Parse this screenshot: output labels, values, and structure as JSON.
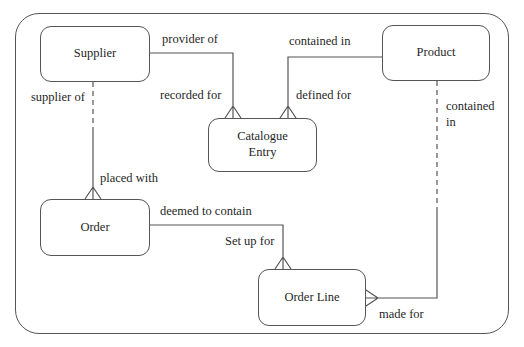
{
  "diagram": {
    "type": "entity-relationship",
    "notation": "crow-foot",
    "entities": [
      {
        "id": "supplier",
        "label": "Supplier"
      },
      {
        "id": "product",
        "label": "Product"
      },
      {
        "id": "catalogue_entry",
        "label": "Catalogue Entry"
      },
      {
        "id": "order",
        "label": "Order"
      },
      {
        "id": "order_line",
        "label": "Order Line"
      }
    ],
    "relationships": [
      {
        "from": "Supplier",
        "to": "Catalogue Entry",
        "from_label": "provider of",
        "to_label": "recorded for",
        "line_style": "solid",
        "many_at": "Catalogue Entry"
      },
      {
        "from": "Product",
        "to": "Catalogue Entry",
        "from_label": "contained in",
        "to_label": "defined for",
        "line_style": "solid",
        "many_at": "Catalogue Entry"
      },
      {
        "from": "Supplier",
        "to": "Order",
        "from_label": "supplier of",
        "to_label": "placed with",
        "line_style": "dashed-to-solid",
        "many_at": "Order"
      },
      {
        "from": "Order",
        "to": "Order Line",
        "from_label": "deemed to contain",
        "to_label": "Set up for",
        "line_style": "solid",
        "many_at": "Order Line"
      },
      {
        "from": "Product",
        "to": "Order Line",
        "from_label": "contained in",
        "to_label": "made for",
        "line_style": "dashed-to-solid",
        "many_at": "Order Line"
      }
    ],
    "colors": {
      "line": "#555555",
      "text": "#1f1f1f",
      "background": "#ffffff"
    }
  }
}
